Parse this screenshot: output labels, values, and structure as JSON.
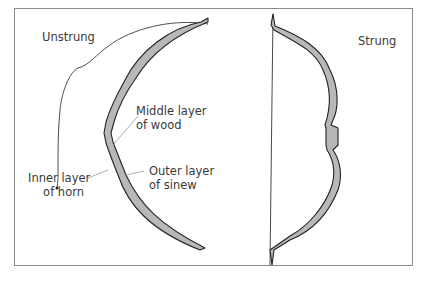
{
  "diagram": {
    "panels": [
      {
        "name": "unstrung",
        "label": "Unstrung"
      },
      {
        "name": "strung",
        "label": "Strung"
      }
    ],
    "annotations": {
      "middle": {
        "line1": "Middle layer",
        "line2": "of wood"
      },
      "inner": {
        "line1": "Inner layer",
        "line2": "of horn"
      },
      "outer": {
        "line1": "Outer layer",
        "line2": "of sinew"
      }
    },
    "colors": {
      "limb_fill": "#b8b8b8",
      "limb_stroke": "#222222",
      "frame": "#8a8a8a",
      "leader": "#9a9a9a",
      "text": "#3a3a3a"
    }
  }
}
